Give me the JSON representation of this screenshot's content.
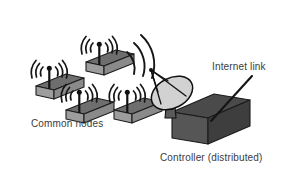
{
  "diagram": {
    "type": "network-topology-illustration",
    "background_color": "#ffffff",
    "labels": {
      "common_nodes": "Common nodes",
      "controller": "Controller (distributed)",
      "internet_link": "Internet link"
    },
    "colors": {
      "node_top_face": "#6e6e6e",
      "node_front_face": "#9d9d9d",
      "node_side_face": "#8a8a8a",
      "node_outline": "#1d1d1d",
      "antenna": "#121212",
      "signal_arc": "#151515",
      "controller_top_face": "#4a4a4a",
      "controller_front_face": "#565656",
      "controller_side_face": "#3e3e3e",
      "dish_face": "#d2d2d2",
      "dish_outline": "#111111",
      "link_line": "#141414",
      "text": "#3b3b3b"
    },
    "nodes": [
      {
        "id": "node-top",
        "label": "common node",
        "x": 72,
        "y": 36,
        "signal_arcs": 3
      },
      {
        "id": "node-left",
        "label": "common node",
        "x": 22,
        "y": 60,
        "signal_arcs": 3
      },
      {
        "id": "node-middle",
        "label": "common node",
        "x": 52,
        "y": 84,
        "signal_arcs": 3
      },
      {
        "id": "node-right",
        "label": "common node",
        "x": 100,
        "y": 84,
        "signal_arcs": 3
      }
    ],
    "uplink_arcs": {
      "count": 3,
      "from": "node-cluster",
      "to": "satellite-dish"
    },
    "satellite_dish": {
      "x": 150,
      "y": 66,
      "mounted_on": "controller"
    },
    "controller": {
      "x": 172,
      "y": 94,
      "width": 76,
      "height": 50
    },
    "internet_link_line": {
      "from_x": 252,
      "from_y": 76,
      "to_x": 212,
      "to_y": 120
    }
  }
}
